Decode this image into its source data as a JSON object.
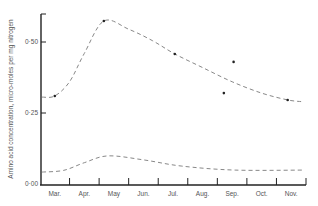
{
  "chart_data": {
    "type": "line",
    "title": "",
    "xlabel": "",
    "ylabel": "Amino acid concentration, micro-moles per mg nitrogen",
    "categories": [
      "Mar.",
      "Apr.",
      "May",
      "Jun.",
      "Jul.",
      "Aug.",
      "Sep.",
      "Oct.",
      "Nov."
    ],
    "x_note": "x is month index: 0 = Mar., 8 = Nov. (fractional = within-month position)",
    "xlim": [
      -0.5,
      8.5
    ],
    "ylim": [
      0,
      0.6
    ],
    "yticks": [
      0,
      0.25,
      0.5
    ],
    "ytick_labels": [
      "0·00",
      "0·25",
      "0·50"
    ],
    "grid": false,
    "legend": "none",
    "series": [
      {
        "name": "upper curve (fitted, dashed)",
        "style": "dashed",
        "x": [
          -0.43,
          0.0,
          0.5,
          1.0,
          1.66,
          2.5,
          3.3,
          4.06,
          5.0,
          6.0,
          7.0,
          7.88,
          8.35
        ],
        "values": [
          0.306,
          0.31,
          0.36,
          0.46,
          0.574,
          0.545,
          0.505,
          0.458,
          0.41,
          0.36,
          0.32,
          0.296,
          0.29
        ]
      },
      {
        "name": "lower curve (fitted, dashed)",
        "style": "dashed",
        "x": [
          -0.43,
          0.3,
          1.0,
          1.8,
          3.0,
          4.3,
          6.1,
          8.45
        ],
        "values": [
          0.042,
          0.048,
          0.075,
          0.099,
          0.085,
          0.063,
          0.049,
          0.049
        ]
      },
      {
        "name": "observed points",
        "style": "markers",
        "x": [
          0.0,
          1.66,
          4.06,
          5.72,
          6.05,
          7.88
        ],
        "values": [
          0.31,
          0.574,
          0.458,
          0.32,
          0.43,
          0.296
        ]
      }
    ]
  }
}
